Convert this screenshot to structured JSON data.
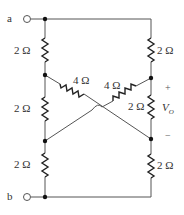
{
  "diagram": {
    "type": "circuit-schematic",
    "terminals": [
      {
        "id": "a",
        "label": "a"
      },
      {
        "id": "b",
        "label": "b"
      }
    ],
    "resistors": [
      {
        "id": "R_left_top",
        "label": "2 Ω",
        "value_ohms": 2
      },
      {
        "id": "R_left_mid",
        "label": "2 Ω",
        "value_ohms": 2
      },
      {
        "id": "R_left_bot",
        "label": "2 Ω",
        "value_ohms": 2
      },
      {
        "id": "R_right_top",
        "label": "2 Ω",
        "value_ohms": 2
      },
      {
        "id": "R_right_mid",
        "label": "2 Ω",
        "value_ohms": 2
      },
      {
        "id": "R_right_bot",
        "label": "2 Ω",
        "value_ohms": 2
      },
      {
        "id": "R_diag_left",
        "label": "4 Ω",
        "value_ohms": 4
      },
      {
        "id": "R_diag_right",
        "label": "4 Ω",
        "value_ohms": 4
      }
    ],
    "output_voltage": {
      "label": "V",
      "subscript": "O",
      "plus": "+",
      "minus": "−"
    }
  }
}
